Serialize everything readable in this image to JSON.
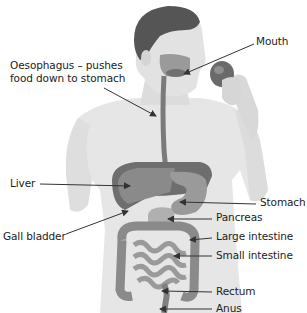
{
  "diagram": {
    "labels": {
      "mouth": "Mouth",
      "oesophagus_line1": "Oesophagus – pushes",
      "oesophagus_line2": "food down to stomach",
      "liver": "Liver",
      "stomach": "Stomach",
      "pancreas": "Pancreas",
      "gall_bladder": "Gall bladder",
      "large_intestine": "Large intestine",
      "small_intestine": "Small intestine",
      "rectum": "Rectum",
      "anus": "Anus"
    },
    "colors": {
      "skin": "#e6e6e6",
      "skin_shade": "#cfcfcf",
      "hair": "#555555",
      "organ_dark": "#6e6e6e",
      "organ_mid": "#8c8c8c",
      "organ_light": "#a8a8a8",
      "arrow": "#333333",
      "text": "#222222"
    }
  }
}
